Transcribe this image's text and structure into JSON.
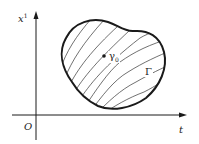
{
  "diagram": {
    "axes": {
      "vertical_label": "x",
      "vertical_label_sup": "1",
      "horizontal_label": "t",
      "origin_label": "O"
    },
    "region": {
      "boundary_label": "Γ",
      "point_label": "γ",
      "point_label_sub": "0",
      "fill": "hatched with curved lines"
    },
    "colors": {
      "stroke": "#1a1a1a",
      "hatch": "#333333",
      "background": "#ffffff"
    }
  }
}
